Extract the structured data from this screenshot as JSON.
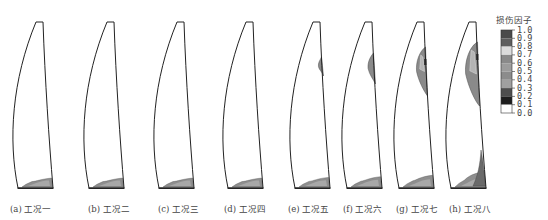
{
  "figure": {
    "panels": [
      {
        "id": "a",
        "caption": "(a) 工况一",
        "damage": {
          "root": 0.35,
          "mid": 0
        }
      },
      {
        "id": "b",
        "caption": "(b) 工况二",
        "damage": {
          "root": 0.35,
          "mid": 0
        }
      },
      {
        "id": "c",
        "caption": "(c) 工况三",
        "damage": {
          "root": 0.35,
          "mid": 0
        }
      },
      {
        "id": "d",
        "caption": "(d) 工况四",
        "damage": {
          "root": 0.35,
          "mid": 0
        }
      },
      {
        "id": "e",
        "caption": "(e) 工况五",
        "damage": {
          "root": 0.4,
          "mid": 0.15
        }
      },
      {
        "id": "f",
        "caption": "(f) 工况六",
        "damage": {
          "root": 0.45,
          "mid": 0.35
        }
      },
      {
        "id": "g",
        "caption": "(g) 工况七",
        "damage": {
          "root": 0.55,
          "mid": 0.65
        }
      },
      {
        "id": "h",
        "caption": "(h) 工况八",
        "damage": {
          "root": 0.8,
          "mid": 0.9
        }
      }
    ],
    "legend": {
      "title": "损伤因子",
      "ticks": [
        "1.0",
        "0.9",
        "0.8",
        "0.7",
        "0.6",
        "0.5",
        "0.4",
        "0.3",
        "0.2",
        "0.1",
        "0.0"
      ],
      "colors": [
        "#4a4a4a",
        "#5e5e5e",
        "#dcdcdc",
        "#8a8a8a",
        "#9c9c9c",
        "#8c8c8c",
        "#a0a0a0",
        "#4e4e4e",
        "#1e1e1e",
        "#ffffff"
      ]
    }
  }
}
